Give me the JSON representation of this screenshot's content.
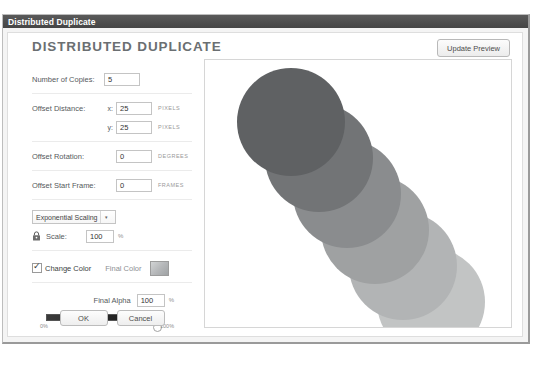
{
  "window": {
    "titlebar_title": "Distributed Duplicate"
  },
  "header": {
    "page_title": "DISTRIBUTED DUPLICATE",
    "update_preview_label": "Update Preview"
  },
  "form": {
    "copies": {
      "label": "Number of Copies:",
      "value": "5"
    },
    "offset_distance": {
      "label": "Offset Distance:",
      "x_axis_label": "x:",
      "x_value": "25",
      "x_unit": "PIXELS",
      "y_axis_label": "y:",
      "y_value": "25",
      "y_unit": "PIXELS"
    },
    "offset_rotation": {
      "label": "Offset Rotation:",
      "value": "0",
      "unit": "DEGREES"
    },
    "offset_start_frame": {
      "label": "Offset Start Frame:",
      "value": "0",
      "unit": "FRAMES"
    },
    "scaling": {
      "selected_option": "Exponential Scaling",
      "caret_icon": "chevron-down-icon",
      "options": [
        "Exponential Scaling",
        "Linear Scaling"
      ]
    },
    "scale": {
      "lock_icon": "lock-icon",
      "label": "Scale:",
      "value": "100",
      "unit": "%"
    },
    "change_color": {
      "checkbox_checked": true,
      "label": "Change Color",
      "final_color_label": "Final Color",
      "swatch_name": "color-swatch",
      "swatch_color": "#b6b8ba"
    },
    "final_alpha": {
      "label": "Final Alpha",
      "value": "100",
      "unit": "%",
      "slider_min_label": "0%",
      "slider_max_label": "100%",
      "slider_percent": 100
    }
  },
  "buttons": {
    "ok_label": "OK",
    "cancel_label": "Cancel"
  },
  "preview": {
    "circles": [
      {
        "left": 32,
        "top": 8,
        "size": 108,
        "color": "#5f6163"
      },
      {
        "left": 60,
        "top": 44,
        "size": 108,
        "color": "#727476"
      },
      {
        "left": 88,
        "top": 80,
        "size": 108,
        "color": "#8a8c8e"
      },
      {
        "left": 116,
        "top": 116,
        "size": 108,
        "color": "#9fa1a2"
      },
      {
        "left": 144,
        "top": 152,
        "size": 108,
        "color": "#b2b4b5"
      },
      {
        "left": 172,
        "top": 188,
        "size": 108,
        "color": "#c2c4c4"
      }
    ]
  }
}
